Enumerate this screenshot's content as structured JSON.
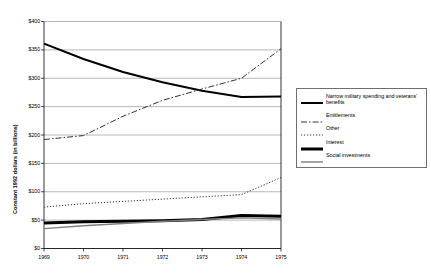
{
  "chart_data": {
    "type": "line",
    "title": "",
    "xlabel": "",
    "ylabel": "Constant 1992 dollars (in billions)",
    "x": [
      1969,
      1970,
      1971,
      1972,
      1973,
      1974,
      1975
    ],
    "categories": [
      "1969",
      "1970",
      "1971",
      "1972",
      "1973",
      "1974",
      "1975"
    ],
    "xlim": [
      1969,
      1975
    ],
    "ylim": [
      0,
      400
    ],
    "ytick_values": [
      0,
      50,
      100,
      150,
      200,
      250,
      300,
      350,
      400
    ],
    "ytick_labels": [
      "$0",
      "$50",
      "$100",
      "$150",
      "$200",
      "$250",
      "$300",
      "$350",
      "$400"
    ],
    "grid": "horizontal",
    "legend_position": "right",
    "series": [
      {
        "name": "Narrow military spending and veterans' benefits",
        "values": [
          361,
          334,
          311,
          293,
          278,
          267,
          268
        ],
        "color": "#000000",
        "style": "solid",
        "width": 2.0
      },
      {
        "name": "Entitlements",
        "values": [
          192,
          199,
          233,
          261,
          281,
          300,
          352
        ],
        "color": "#333333",
        "style": "dashdot",
        "width": 1.0
      },
      {
        "name": "Other",
        "values": [
          73,
          79,
          83,
          87,
          91,
          95,
          125
        ],
        "color": "#333333",
        "style": "dotted",
        "width": 1.0
      },
      {
        "name": "Interest",
        "values": [
          45,
          47,
          48,
          49,
          51,
          58,
          57
        ],
        "color": "#000000",
        "style": "solid",
        "width": 3.0
      },
      {
        "name": "Social investments",
        "values": [
          35,
          40,
          44,
          48,
          51,
          54,
          52
        ],
        "color": "#7f7f7f",
        "style": "solid",
        "width": 1.4
      }
    ]
  },
  "legend": {
    "entries": [
      "Narrow military spending and veterans' benefits",
      "Entitlements",
      "Other",
      "Interest",
      "Social investments"
    ]
  }
}
